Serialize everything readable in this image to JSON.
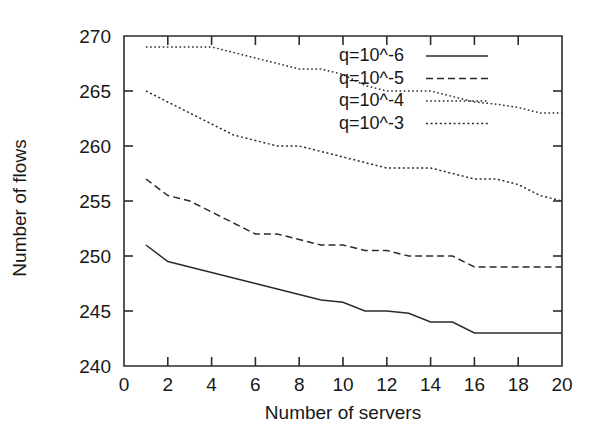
{
  "chart_data": {
    "type": "line",
    "title": "",
    "xlabel": "Number of servers",
    "ylabel": "Number of flows",
    "xlim": [
      0,
      20
    ],
    "ylim": [
      240,
      270
    ],
    "xticks": [
      0,
      2,
      4,
      6,
      8,
      10,
      12,
      14,
      16,
      18,
      20
    ],
    "xticklabels": [
      "0",
      "2",
      "4",
      "6",
      "8",
      "10",
      "12",
      "14",
      "16",
      "18",
      "20"
    ],
    "yticks": [
      240,
      245,
      250,
      255,
      260,
      265,
      270
    ],
    "yticklabels": [
      "240",
      "245",
      "250",
      "255",
      "260",
      "265",
      "270"
    ],
    "grid": false,
    "legend_position": "upper right",
    "x": [
      1,
      2,
      3,
      4,
      5,
      6,
      7,
      8,
      9,
      10,
      11,
      12,
      13,
      14,
      15,
      16,
      17,
      18,
      19,
      20
    ],
    "series": [
      {
        "name": "q=10^-6",
        "style": "solid",
        "values": [
          251,
          249.5,
          249,
          248.5,
          248,
          247.5,
          247,
          246.5,
          246,
          245.8,
          245,
          245,
          244.8,
          244,
          244,
          243,
          243,
          243,
          243,
          243
        ]
      },
      {
        "name": "q=10^-5",
        "style": "dashed",
        "values": [
          257,
          255.5,
          255,
          254,
          253,
          252,
          252,
          251.5,
          251,
          251,
          250.5,
          250.5,
          250,
          250,
          250,
          249,
          249,
          249,
          249,
          249
        ]
      },
      {
        "name": "q=10^-4",
        "style": "dotted",
        "values": [
          269,
          269,
          269,
          269,
          268.5,
          268,
          267.5,
          267,
          267,
          266.5,
          265.5,
          265,
          265,
          265,
          264.5,
          264,
          263.8,
          263.5,
          263,
          263
        ]
      },
      {
        "name": "q=10^-3",
        "style": "dashdot",
        "values": [
          265,
          264,
          263,
          262,
          261,
          260.5,
          260,
          260,
          259.5,
          259,
          258.5,
          258,
          258,
          258,
          257.5,
          257,
          257,
          256.5,
          255.5,
          255
        ]
      }
    ]
  },
  "legend": {
    "entries": [
      {
        "label": "q=10^-6",
        "style": "solid"
      },
      {
        "label": "q=10^-5",
        "style": "dashed"
      },
      {
        "label": "q=10^-4",
        "style": "dotted"
      },
      {
        "label": "q=10^-3",
        "style": "dashdot"
      }
    ]
  }
}
